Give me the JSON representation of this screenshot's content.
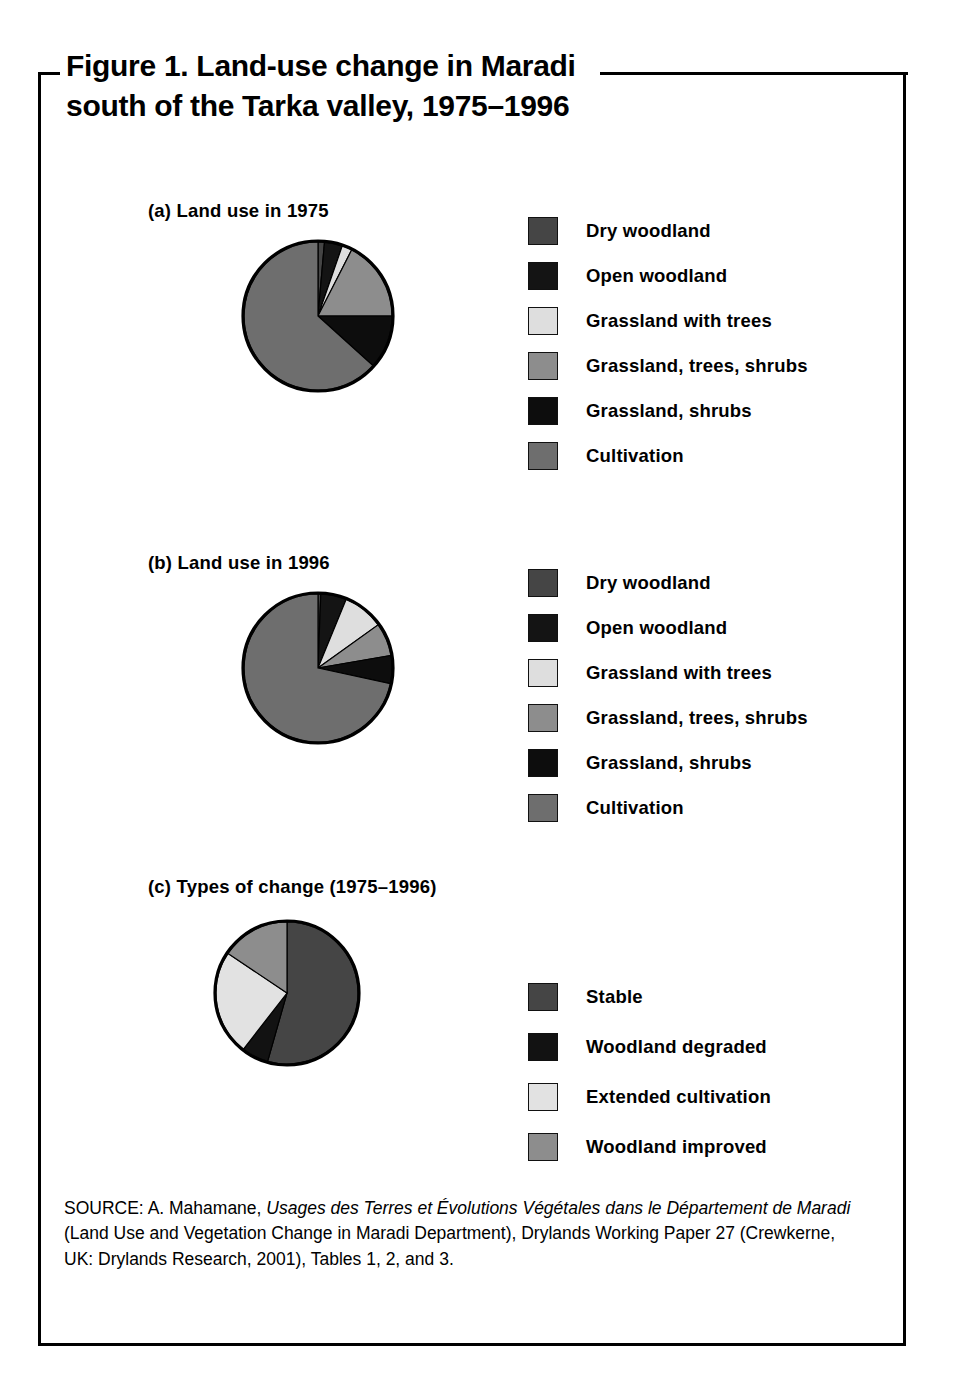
{
  "figure": {
    "title": "Figure 1. Land-use change in Maradi\nsouth of the Tarka valley, 1975–1996",
    "source_parts": {
      "p1": "SOURCE: A. Mahamane, ",
      "i1": "Usages des Terres et Évolutions Végétales dans le Département de Maradi",
      "p2": " (Land Use and Vegetation Change in Maradi Department), Drylands Working Paper 27 (Crewkerne, UK: Drylands Research, 2001), Tables 1, 2, and 3."
    }
  },
  "colors": {
    "dry_woodland": "#454545",
    "open_woodland": "#141414",
    "grassland_with_trees": "#dedede",
    "grassland_trees_shrubs": "#8d8d8d",
    "grassland_shrubs": "#0d0d0d",
    "cultivation": "#6e6e6e",
    "stable": "#454545",
    "woodland_degraded": "#121212",
    "extended_cultivation": "#e2e2e2",
    "woodland_improved": "#8d8d8d",
    "outline": "#000000"
  },
  "panels": [
    {
      "id": "a",
      "caption": "(a) Land use in 1975",
      "legend": [
        {
          "label": "Dry woodland",
          "color": "#454545"
        },
        {
          "label": "Open woodland",
          "color": "#141414"
        },
        {
          "label": "Grassland with trees",
          "color": "#dedede"
        },
        {
          "label": "Grassland, trees, shrubs",
          "color": "#8d8d8d"
        },
        {
          "label": "Grassland, shrubs",
          "color": "#0d0d0d"
        },
        {
          "label": "Cultivation",
          "color": "#6e6e6e"
        }
      ]
    },
    {
      "id": "b",
      "caption": "(b) Land use in 1996",
      "legend": [
        {
          "label": "Dry woodland",
          "color": "#454545"
        },
        {
          "label": "Open woodland",
          "color": "#141414"
        },
        {
          "label": "Grassland with trees",
          "color": "#dedede"
        },
        {
          "label": "Grassland, trees, shrubs",
          "color": "#8d8d8d"
        },
        {
          "label": "Grassland, shrubs",
          "color": "#0d0d0d"
        },
        {
          "label": "Cultivation",
          "color": "#6e6e6e"
        }
      ]
    },
    {
      "id": "c",
      "caption": "(c) Types of change (1975–1996)",
      "legend": [
        {
          "label": "Stable",
          "color": "#454545"
        },
        {
          "label": "Woodland degraded",
          "color": "#121212"
        },
        {
          "label": "Extended cultivation",
          "color": "#e2e2e2"
        },
        {
          "label": "Woodland improved",
          "color": "#8d8d8d"
        }
      ]
    }
  ],
  "chart_data": [
    {
      "type": "pie",
      "id": "a",
      "title": "(a) Land use in 1975",
      "categories": [
        "Dry woodland",
        "Open woodland",
        "Grassland with trees",
        "Grassland, trees, shrubs",
        "Grassland, shrubs",
        "Cultivation"
      ],
      "values": [
        1.4,
        3.9,
        2.2,
        17.5,
        11.7,
        63.3
      ],
      "unit": "percent of area",
      "start_angle_deg": 0,
      "direction": "clockwise",
      "colors": [
        "#454545",
        "#141414",
        "#dedede",
        "#8d8d8d",
        "#0d0d0d",
        "#6e6e6e"
      ],
      "legend_position": "right",
      "grid": false
    },
    {
      "type": "pie",
      "id": "b",
      "title": "(b) Land use in 1996",
      "categories": [
        "Dry woodland",
        "Open woodland",
        "Grassland with trees",
        "Grassland, trees, shrubs",
        "Grassland, shrubs",
        "Cultivation"
      ],
      "values": [
        0.6,
        5.6,
        8.9,
        7.2,
        6.1,
        71.6
      ],
      "unit": "percent of area",
      "start_angle_deg": 0,
      "direction": "clockwise",
      "colors": [
        "#454545",
        "#141414",
        "#dedede",
        "#8d8d8d",
        "#0d0d0d",
        "#6e6e6e"
      ],
      "legend_position": "right",
      "grid": false
    },
    {
      "type": "pie",
      "id": "c",
      "title": "(c) Types of change (1975–1996)",
      "categories": [
        "Stable",
        "Woodland degraded",
        "Extended cultivation",
        "Woodland improved"
      ],
      "values": [
        54.4,
        6.1,
        23.9,
        15.6
      ],
      "unit": "percent of area",
      "start_angle_deg": 0,
      "direction": "clockwise",
      "colors": [
        "#454545",
        "#121212",
        "#e2e2e2",
        "#8d8d8d"
      ],
      "legend_position": "right",
      "grid": false
    }
  ]
}
